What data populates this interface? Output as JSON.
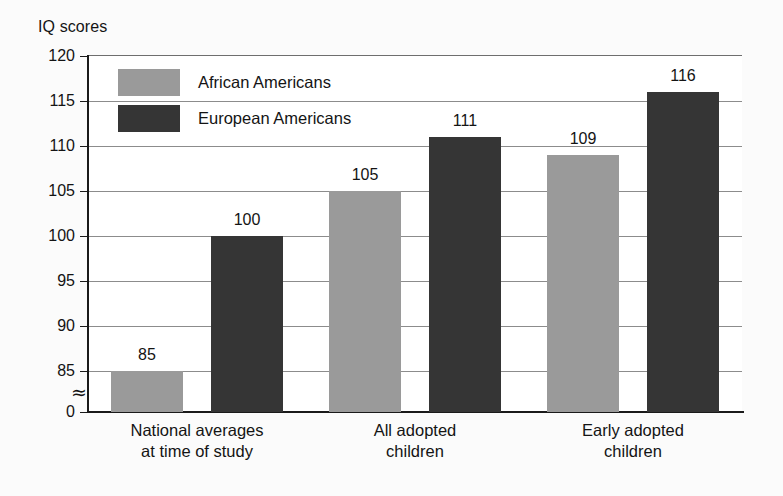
{
  "chart_data": {
    "type": "bar",
    "title": "",
    "ylabel": "IQ scores",
    "xlabel": "",
    "categories": [
      "National averages at time of study",
      "All adopted children",
      "Early adopted children"
    ],
    "category_lines": [
      [
        "National averages",
        "at time of study"
      ],
      [
        "All adopted",
        "children"
      ],
      [
        "Early adopted",
        "children"
      ]
    ],
    "series": [
      {
        "name": "African Americans",
        "color": "#9a9a9a",
        "values": [
          85,
          105,
          109
        ]
      },
      {
        "name": "European Americans",
        "color": "#353535",
        "values": [
          100,
          111,
          116
        ]
      }
    ],
    "ylim": [
      85,
      120
    ],
    "yticks": [
      120,
      115,
      110,
      105,
      100,
      95,
      90,
      85,
      0
    ],
    "ytick_labels": [
      "120",
      "115",
      "110",
      "105",
      "100",
      "95",
      "90",
      "85",
      "0"
    ],
    "axis_break": true,
    "axis_break_symbol": "≈",
    "grid": true,
    "legend_position": "top-left",
    "bar_labels": [
      "85",
      "100",
      "105",
      "111",
      "109",
      "116"
    ]
  },
  "legend": {
    "items": [
      {
        "label": "African Americans",
        "color": "#9a9a9a"
      },
      {
        "label": "European Americans",
        "color": "#353535"
      }
    ]
  },
  "colors": {
    "background": "#fbfbfb",
    "plot_background": "#ffffff",
    "axis": "#1a1a1a",
    "gridline": "#8c8c8c",
    "text": "#141414",
    "series_light": "#9a9a9a",
    "series_dark": "#353535"
  }
}
